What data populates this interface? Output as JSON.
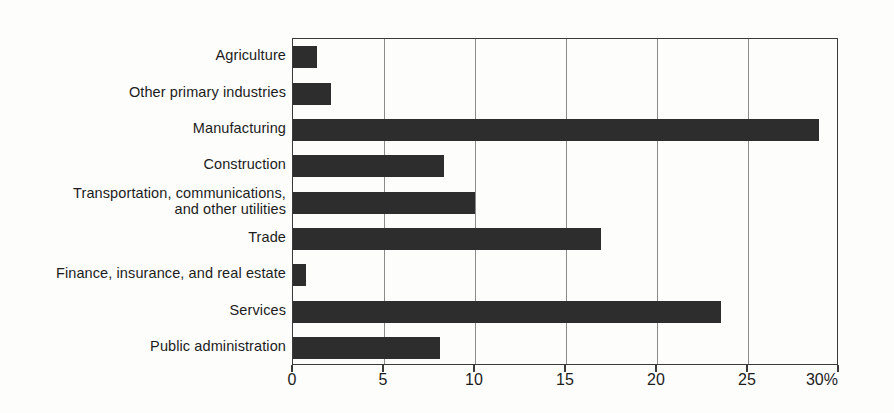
{
  "chart_data": {
    "type": "bar",
    "orientation": "horizontal",
    "title": "",
    "xlabel": "",
    "ylabel": "",
    "categories": [
      "Agriculture",
      "Other primary industries",
      "Manufacturing",
      "Construction",
      "Transportation, communications, and other utilities",
      "Trade",
      "Finance, insurance, and real estate",
      "Services",
      "Public administration"
    ],
    "category_lines": [
      [
        "Agriculture"
      ],
      [
        "Other primary industries"
      ],
      [
        "Manufacturing"
      ],
      [
        "Construction"
      ],
      [
        "Transportation, communications,",
        "and other utilities"
      ],
      [
        "Trade"
      ],
      [
        "Finance, insurance, and real estate"
      ],
      [
        "Services"
      ],
      [
        "Public administration"
      ]
    ],
    "values": [
      1.3,
      2.1,
      28.9,
      8.3,
      10.0,
      16.9,
      0.7,
      23.5,
      8.1
    ],
    "xlim": [
      0,
      30
    ],
    "xticks": [
      0,
      5,
      10,
      15,
      20,
      25,
      30
    ],
    "xtick_labels": [
      "0",
      "5",
      "10",
      "15",
      "20",
      "25",
      "30%"
    ],
    "unit": "%",
    "grid": true,
    "grid_axis": "x",
    "legend": false,
    "bar_color": "#2d2d2d",
    "grid_color": "#8b8b8b",
    "axis_color": "#3a3a3a",
    "background_color": "#fdfdfb"
  }
}
